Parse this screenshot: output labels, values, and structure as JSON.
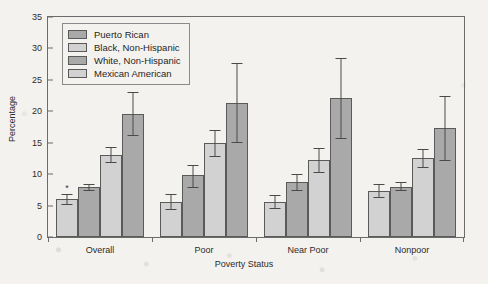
{
  "chart_data": {
    "type": "bar",
    "title": "",
    "xlabel": "Poverty Status",
    "ylabel": "Percentage",
    "ylim": [
      0,
      35
    ],
    "ytick_step": 5,
    "yticks": [
      0,
      5,
      10,
      15,
      20,
      25,
      30,
      35
    ],
    "grid": false,
    "legend_position": "upper-left-inside",
    "categories": [
      "Overall",
      "Poor",
      "Near Poor",
      "Nonpoor"
    ],
    "series": [
      {
        "name": "Puerto Rican",
        "color": "#d2d2d2",
        "values": [
          6.0,
          5.6,
          5.5,
          7.4
        ],
        "err_low": [
          5.2,
          4.5,
          4.6,
          6.4
        ],
        "err_high": [
          6.8,
          6.8,
          6.7,
          8.4
        ],
        "annotations": [
          "*",
          "",
          "",
          ""
        ]
      },
      {
        "name": "Black, Non-Hispanic",
        "color": "#a9a9a9",
        "values": [
          8.0,
          9.8,
          8.8,
          8.0
        ],
        "err_low": [
          7.5,
          8.0,
          7.5,
          7.4
        ],
        "err_high": [
          8.5,
          11.5,
          10.1,
          8.7
        ],
        "annotations": [
          "",
          "",
          "",
          ""
        ]
      },
      {
        "name": "White, Non-Hispanic",
        "color": "#d2d2d2",
        "values": [
          13.1,
          15.0,
          12.2,
          12.6
        ],
        "err_low": [
          12.0,
          12.9,
          10.3,
          11.2
        ],
        "err_high": [
          14.3,
          17.1,
          14.1,
          14.0
        ],
        "annotations": [
          "",
          "",
          "",
          ""
        ]
      },
      {
        "name": "Mexican American",
        "color": "#a9a9a9",
        "values": [
          19.6,
          21.3,
          22.1,
          17.3
        ],
        "err_low": [
          16.2,
          15.1,
          15.8,
          12.3
        ],
        "err_high": [
          23.0,
          27.7,
          28.5,
          22.4
        ],
        "annotations": [
          "",
          "",
          "",
          ""
        ]
      }
    ]
  },
  "legend": {
    "items": [
      {
        "label": "Puerto Rican"
      },
      {
        "label": "Black, Non-Hispanic"
      },
      {
        "label": "White, Non-Hispanic"
      },
      {
        "label": "Mexican American"
      }
    ]
  }
}
